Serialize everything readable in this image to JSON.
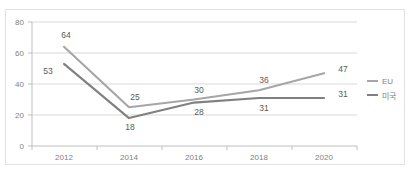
{
  "chart_data": {
    "type": "line",
    "title": "",
    "subtitle": "",
    "xlabel": "",
    "ylabel": "",
    "categories": [
      "2012",
      "2014",
      "2016",
      "2018",
      "2020"
    ],
    "series": [
      {
        "name": "EU",
        "color": "#a6a6a6",
        "values": [
          64,
          25,
          30,
          36,
          47
        ],
        "label_position": "above"
      },
      {
        "name": "미국",
        "color": "#808080",
        "values": [
          53,
          18,
          28,
          31,
          31
        ],
        "label_position": "below"
      }
    ],
    "ylim": [
      0,
      80
    ],
    "ytick_labels": [
      "0",
      "20",
      "40",
      "60",
      "80"
    ],
    "ytick_values": [
      0,
      20,
      40,
      60,
      80
    ],
    "xtick_labels": [
      "2012",
      "2014",
      "2016",
      "2018",
      "2020"
    ],
    "grid": "horizontal",
    "legend_position": "right",
    "legend_entries": [
      "EU",
      "미국"
    ],
    "data_labels": {
      "eu": [
        "64",
        "25",
        "30",
        "36",
        "47"
      ],
      "us": [
        "53",
        "18",
        "28",
        "31",
        "31"
      ]
    }
  },
  "colors": {
    "eu_line": "#a6a6a6",
    "us_line": "#808080",
    "gridline": "#d9d9d9",
    "axis": "#bfbfbf",
    "tick_text": "#7f7f7f",
    "data_label_text": "#595959",
    "frame_border": "#e2e2e2",
    "background": "#ffffff"
  },
  "artifact": {
    "top_right_text": ""
  }
}
